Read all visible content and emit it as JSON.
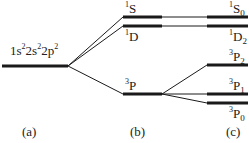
{
  "config_label": {
    "base": "1s",
    "sup1": "2",
    "mid": "2s",
    "sup2": "2",
    "mid2": "2p",
    "sup3": "2"
  },
  "terms_b": [
    {
      "sup": "1",
      "letter": "S"
    },
    {
      "sup": "1",
      "letter": "D"
    },
    {
      "sup": "3",
      "letter": "P"
    }
  ],
  "levels_c": [
    {
      "sup": "1",
      "letter": "S",
      "sub": "0"
    },
    {
      "sup": "1",
      "letter": "D",
      "sub": "2"
    },
    {
      "sup": "3",
      "letter": "P",
      "sub": "2"
    },
    {
      "sup": "3",
      "letter": "P",
      "sub": "1"
    },
    {
      "sup": "3",
      "letter": "P",
      "sub": "0"
    }
  ],
  "panel_labels": {
    "a": "(a)",
    "b": "(b)",
    "c": "(c)"
  },
  "colors": {
    "line": "#1a1a1a"
  }
}
